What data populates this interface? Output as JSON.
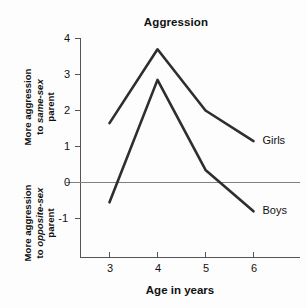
{
  "chart_data": {
    "type": "line",
    "title": "Aggression",
    "xlabel": "Age in years",
    "ylabel_upper_line1": "More aggression",
    "ylabel_upper_line2_prefix": "to ",
    "ylabel_upper_line2_em": "same-sex",
    "ylabel_upper_line3": "parent",
    "ylabel_lower_line1": "More aggression",
    "ylabel_lower_line2_prefix": "to ",
    "ylabel_lower_line2_em": "opposite-sex",
    "ylabel_lower_line3": "parent",
    "x": [
      3,
      4,
      5,
      6
    ],
    "xticklabels": [
      "3",
      "4",
      "5",
      "6"
    ],
    "yticklabels": [
      "4",
      "3",
      "2",
      "1",
      "0",
      "-1"
    ],
    "ytickvalues": [
      4,
      3,
      2,
      1,
      0,
      -1
    ],
    "xlim": [
      2.5,
      6.6
    ],
    "ylim": [
      -1.6,
      4.1
    ],
    "grid": false,
    "zero_line": true,
    "legend_position": "line-end-labels",
    "series": [
      {
        "name": "Girls",
        "values": [
          1.65,
          3.7,
          2.0,
          1.15
        ],
        "color": "#2e2e2e"
      },
      {
        "name": "Boys",
        "values": [
          -0.55,
          2.85,
          0.35,
          -0.8
        ],
        "color": "#2e2e2e"
      }
    ]
  },
  "colors": {
    "line": "#2e2e2e",
    "axis": "#555555",
    "zero_line": "#808080",
    "text": "#111111",
    "background": "#fdfdfd"
  }
}
